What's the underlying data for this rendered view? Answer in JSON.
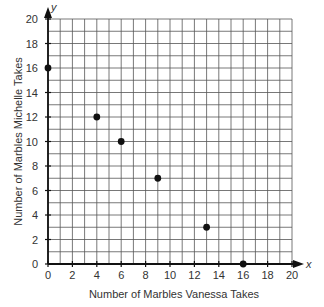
{
  "chart_data": {
    "type": "scatter",
    "title": "",
    "xlabel": "Number of Marbles Vanessa Takes",
    "ylabel": "Number of Marbles Michelle Takes",
    "x_axis_var": "x",
    "y_axis_var": "y",
    "xlim": [
      0,
      20
    ],
    "ylim": [
      0,
      20
    ],
    "grid": true,
    "grid_step": 1,
    "xticks": [
      0,
      2,
      4,
      6,
      8,
      10,
      12,
      14,
      16,
      18,
      20
    ],
    "yticks": [
      0,
      2,
      4,
      6,
      8,
      10,
      12,
      14,
      16,
      18,
      20
    ],
    "points": [
      {
        "x": 0,
        "y": 16
      },
      {
        "x": 4,
        "y": 12
      },
      {
        "x": 6,
        "y": 10
      },
      {
        "x": 9,
        "y": 7
      },
      {
        "x": 13,
        "y": 3
      },
      {
        "x": 16,
        "y": 0
      }
    ],
    "colors": {
      "grid": "#555555",
      "axis": "#111111",
      "point": "#111111"
    }
  }
}
